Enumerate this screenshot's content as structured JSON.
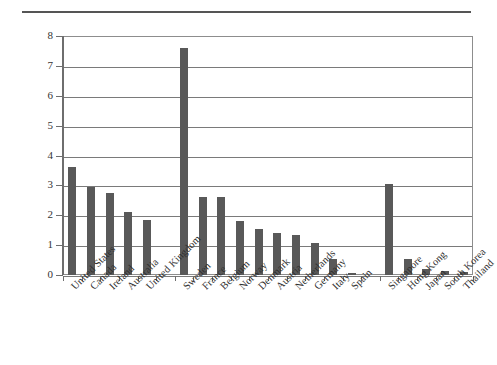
{
  "chart_data": {
    "type": "bar",
    "title": "",
    "subtitle": "",
    "xlabel": "",
    "ylabel": "",
    "ylim": [
      0,
      8
    ],
    "ytick_labels": [
      "0",
      "1",
      "2",
      "3",
      "4",
      "5",
      "6",
      "7",
      "8"
    ],
    "ytick_values": [
      0,
      1,
      2,
      3,
      4,
      5,
      6,
      7,
      8
    ],
    "grid": true,
    "legend": "none",
    "bar_color": "#595959",
    "axis_color": "#6e6e6e",
    "gridline_color": "#7a7a7a",
    "categories": [
      "United States",
      "Canada",
      "Ireland",
      "Australia",
      "United Kingdom",
      "",
      "Sweden",
      "France",
      "Belgium",
      "Norway",
      "Denmark",
      "Austria",
      "Netherlands",
      "Germany",
      "Italy",
      "Spain",
      "",
      "Singapore",
      "Hong Kong",
      "Japan",
      "South Korea",
      "Thailand"
    ],
    "values": [
      3.6,
      2.95,
      2.75,
      2.1,
      1.85,
      null,
      7.6,
      2.62,
      2.6,
      1.82,
      1.55,
      1.4,
      1.33,
      1.08,
      0.55,
      0.08,
      null,
      3.05,
      0.52,
      0.2,
      0.15,
      0.1
    ]
  }
}
